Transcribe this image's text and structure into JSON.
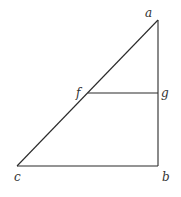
{
  "diagram": {
    "type": "geometric-figure",
    "points": {
      "a": {
        "label": "a",
        "x": 158,
        "y": 20
      },
      "b": {
        "label": "b",
        "x": 158,
        "y": 166
      },
      "c": {
        "label": "c",
        "x": 17,
        "y": 166
      },
      "f": {
        "label": "f",
        "x": 88,
        "y": 93
      },
      "g": {
        "label": "g",
        "x": 158,
        "y": 93
      }
    },
    "segments": [
      {
        "from": "a",
        "to": "c"
      },
      {
        "from": "a",
        "to": "b"
      },
      {
        "from": "c",
        "to": "b"
      },
      {
        "from": "f",
        "to": "g"
      }
    ],
    "labels": {
      "a": "a",
      "b": "b",
      "c": "c",
      "f": "f",
      "g": "g"
    },
    "line_color": "#2a2a2a",
    "background": "#ffffff"
  }
}
